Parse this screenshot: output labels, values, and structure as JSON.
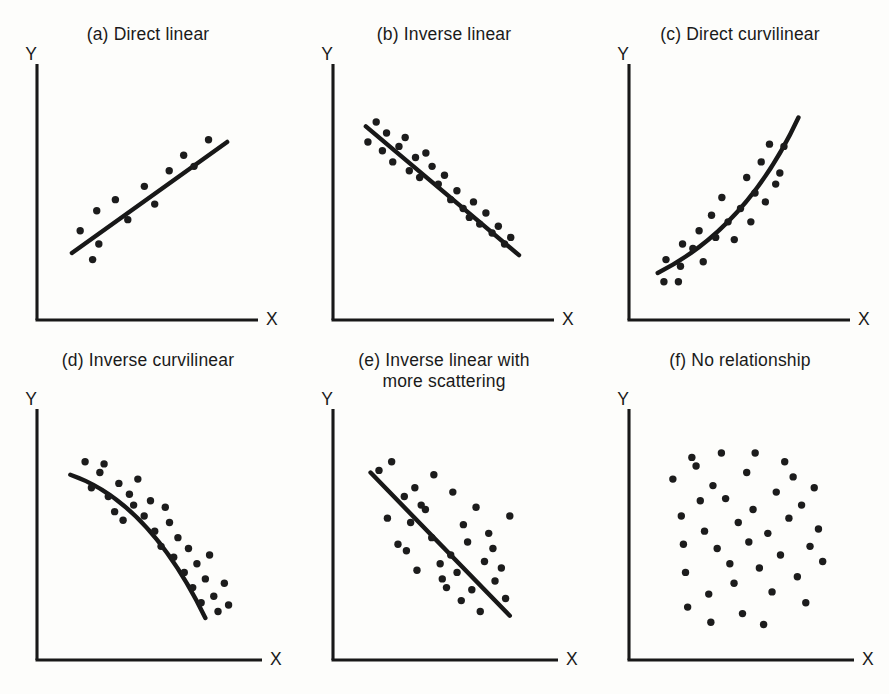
{
  "figure": {
    "background": "#fdfdfb",
    "ink": "#1a1a1a",
    "dot_color": "#1c1c1c",
    "columns": 3,
    "rows": 2
  },
  "chart_data": [
    {
      "type": "scatter",
      "id": "a",
      "title": "(a) Direct linear",
      "xlabel": "X",
      "ylabel": "Y",
      "grid": false,
      "legend": "none",
      "xlim": [
        0,
        100
      ],
      "ylim": [
        0,
        100
      ],
      "fit": {
        "kind": "line",
        "x": [
          13,
          88
        ],
        "y": [
          23,
          73
        ]
      },
      "points": [
        [
          17,
          33
        ],
        [
          23,
          20
        ],
        [
          25,
          42
        ],
        [
          26,
          27
        ],
        [
          34,
          47
        ],
        [
          40,
          38
        ],
        [
          48,
          53
        ],
        [
          53,
          45
        ],
        [
          60,
          60
        ],
        [
          67,
          67
        ],
        [
          72,
          62
        ],
        [
          79,
          74
        ]
      ]
    },
    {
      "type": "scatter",
      "id": "b",
      "title": "(b) Inverse linear",
      "xlabel": "X",
      "ylabel": "Y",
      "grid": false,
      "legend": "none",
      "xlim": [
        0,
        100
      ],
      "ylim": [
        0,
        100
      ],
      "fit": {
        "kind": "line",
        "x": [
          12,
          86
        ],
        "y": [
          80,
          22
        ]
      },
      "points": [
        [
          13,
          73
        ],
        [
          17,
          82
        ],
        [
          20,
          69
        ],
        [
          22,
          77
        ],
        [
          25,
          64
        ],
        [
          28,
          71
        ],
        [
          31,
          75
        ],
        [
          33,
          60
        ],
        [
          36,
          66
        ],
        [
          38,
          57
        ],
        [
          41,
          68
        ],
        [
          44,
          62
        ],
        [
          47,
          54
        ],
        [
          50,
          58
        ],
        [
          53,
          47
        ],
        [
          56,
          51
        ],
        [
          59,
          43
        ],
        [
          62,
          39
        ],
        [
          64,
          46
        ],
        [
          67,
          36
        ],
        [
          70,
          41
        ],
        [
          73,
          32
        ],
        [
          76,
          35
        ],
        [
          79,
          27
        ],
        [
          82,
          30
        ]
      ]
    },
    {
      "type": "scatter",
      "id": "c",
      "title": "(c) Direct curvilinear",
      "xlabel": "X",
      "ylabel": "Y",
      "grid": false,
      "legend": "none",
      "xlim": [
        0,
        100
      ],
      "ylim": [
        0,
        100
      ],
      "fit": {
        "kind": "curve",
        "x": [
          10,
          40,
          62,
          78
        ],
        "y": [
          14,
          28,
          52,
          84
        ]
      },
      "points": [
        [
          13,
          10
        ],
        [
          14,
          20
        ],
        [
          20,
          10
        ],
        [
          21,
          17
        ],
        [
          22,
          27
        ],
        [
          27,
          25
        ],
        [
          30,
          33
        ],
        [
          32,
          19
        ],
        [
          36,
          40
        ],
        [
          38,
          30
        ],
        [
          41,
          48
        ],
        [
          44,
          37
        ],
        [
          47,
          29
        ],
        [
          50,
          43
        ],
        [
          53,
          57
        ],
        [
          55,
          37
        ],
        [
          57,
          50
        ],
        [
          60,
          64
        ],
        [
          62,
          46
        ],
        [
          64,
          72
        ],
        [
          67,
          54
        ],
        [
          69,
          59
        ],
        [
          71,
          71
        ]
      ]
    },
    {
      "type": "scatter",
      "id": "d",
      "title": "(d) Inverse curvilinear",
      "xlabel": "X",
      "ylabel": "Y",
      "grid": false,
      "legend": "none",
      "xlim": [
        0,
        100
      ],
      "ylim": [
        0,
        100
      ],
      "fit": {
        "kind": "curve",
        "x": [
          12,
          36,
          58,
          76
        ],
        "y": [
          78,
          70,
          48,
          12
        ]
      },
      "points": [
        [
          19,
          84
        ],
        [
          22,
          72
        ],
        [
          26,
          79
        ],
        [
          28,
          83
        ],
        [
          30,
          68
        ],
        [
          33,
          61
        ],
        [
          35,
          74
        ],
        [
          37,
          57
        ],
        [
          40,
          69
        ],
        [
          42,
          64
        ],
        [
          44,
          76
        ],
        [
          47,
          59
        ],
        [
          50,
          66
        ],
        [
          52,
          52
        ],
        [
          55,
          45
        ],
        [
          57,
          63
        ],
        [
          59,
          56
        ],
        [
          61,
          40
        ],
        [
          63,
          49
        ],
        [
          66,
          33
        ],
        [
          68,
          44
        ],
        [
          70,
          26
        ],
        [
          72,
          37
        ],
        [
          74,
          19
        ],
        [
          76,
          30
        ],
        [
          78,
          41
        ],
        [
          80,
          22
        ],
        [
          82,
          15
        ],
        [
          85,
          28
        ],
        [
          87,
          18
        ]
      ]
    },
    {
      "type": "scatter",
      "id": "e",
      "title": "(e) Inverse linear with\nmore scattering",
      "xlabel": "X",
      "ylabel": "Y",
      "grid": false,
      "legend": "none",
      "xlim": [
        0,
        100
      ],
      "ylim": [
        0,
        100
      ],
      "fit": {
        "kind": "line",
        "x": [
          14,
          80
        ],
        "y": [
          79,
          13
        ]
      },
      "points": [
        [
          18,
          80
        ],
        [
          22,
          58
        ],
        [
          24,
          84
        ],
        [
          27,
          46
        ],
        [
          30,
          68
        ],
        [
          31,
          43
        ],
        [
          33,
          56
        ],
        [
          35,
          72
        ],
        [
          36,
          34
        ],
        [
          38,
          64
        ],
        [
          40,
          62
        ],
        [
          43,
          49
        ],
        [
          44,
          78
        ],
        [
          47,
          37
        ],
        [
          48,
          30
        ],
        [
          50,
          26
        ],
        [
          52,
          41
        ],
        [
          53,
          70
        ],
        [
          55,
          33
        ],
        [
          57,
          20
        ],
        [
          58,
          55
        ],
        [
          60,
          47
        ],
        [
          62,
          25
        ],
        [
          64,
          63
        ],
        [
          66,
          15
        ],
        [
          68,
          38
        ],
        [
          70,
          51
        ],
        [
          72,
          44
        ],
        [
          73,
          29
        ],
        [
          76,
          35
        ],
        [
          78,
          21
        ],
        [
          80,
          59
        ]
      ]
    },
    {
      "type": "scatter",
      "id": "f",
      "title": "(f) No relationship",
      "xlabel": "X",
      "ylabel": "Y",
      "grid": false,
      "legend": "none",
      "xlim": [
        0,
        100
      ],
      "ylim": [
        0,
        100
      ],
      "fit": null,
      "points": [
        [
          17,
          76
        ],
        [
          21,
          59
        ],
        [
          22,
          46
        ],
        [
          23,
          33
        ],
        [
          24,
          17
        ],
        [
          26,
          86
        ],
        [
          28,
          82
        ],
        [
          30,
          66
        ],
        [
          32,
          52
        ],
        [
          34,
          23
        ],
        [
          35,
          10
        ],
        [
          36,
          73
        ],
        [
          38,
          44
        ],
        [
          40,
          88
        ],
        [
          42,
          67
        ],
        [
          44,
          37
        ],
        [
          46,
          28
        ],
        [
          48,
          56
        ],
        [
          50,
          14
        ],
        [
          52,
          79
        ],
        [
          53,
          47
        ],
        [
          55,
          62
        ],
        [
          56,
          88
        ],
        [
          58,
          35
        ],
        [
          60,
          9
        ],
        [
          62,
          51
        ],
        [
          64,
          24
        ],
        [
          66,
          70
        ],
        [
          68,
          41
        ],
        [
          70,
          84
        ],
        [
          72,
          58
        ],
        [
          74,
          77
        ],
        [
          76,
          31
        ],
        [
          78,
          64
        ],
        [
          80,
          19
        ],
        [
          82,
          45
        ],
        [
          84,
          72
        ],
        [
          86,
          53
        ],
        [
          88,
          38
        ]
      ]
    }
  ]
}
